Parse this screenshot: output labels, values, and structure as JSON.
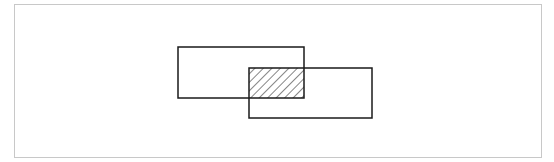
{
  "diagram": {
    "type": "set-intersection",
    "frame": {
      "x": 14,
      "y": 4,
      "w": 528,
      "h": 154,
      "border_color": "#c8c8c8"
    },
    "rect_a": {
      "x": 178,
      "y": 47,
      "w": 126,
      "h": 51
    },
    "rect_b": {
      "x": 249,
      "y": 68,
      "w": 123,
      "h": 50
    },
    "overlap": {
      "x": 249,
      "y": 68,
      "w": 55,
      "h": 30,
      "fill": "hatched"
    },
    "stroke_color": "#1a1a1a",
    "hatch_color": "#333333"
  }
}
